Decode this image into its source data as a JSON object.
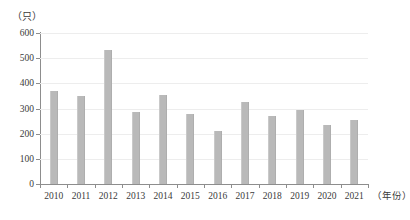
{
  "chart_data": {
    "type": "bar",
    "title": "",
    "xlabel": "（年份）",
    "ylabel": "（只）",
    "categories": [
      "2010",
      "2011",
      "2012",
      "2013",
      "2014",
      "2015",
      "2016",
      "2017",
      "2018",
      "2019",
      "2020",
      "2021"
    ],
    "values": [
      370,
      350,
      532,
      288,
      355,
      280,
      212,
      327,
      272,
      293,
      236,
      256
    ],
    "series": [
      {
        "name": "数量",
        "values": [
          370,
          350,
          532,
          288,
          355,
          280,
          212,
          327,
          272,
          293,
          236,
          256
        ]
      }
    ],
    "ylim": [
      0,
      600
    ],
    "ytick_labels": [
      "0",
      "100",
      "200",
      "300",
      "400",
      "500",
      "600"
    ],
    "ytick_values": [
      0,
      100,
      200,
      300,
      400,
      500,
      600
    ],
    "grid": true,
    "legend": "none",
    "bar_color": "#b9b9b9",
    "axis_color": "#8d8d8d",
    "grid_color": "#ededed",
    "text_color": "#3a3a3a"
  }
}
